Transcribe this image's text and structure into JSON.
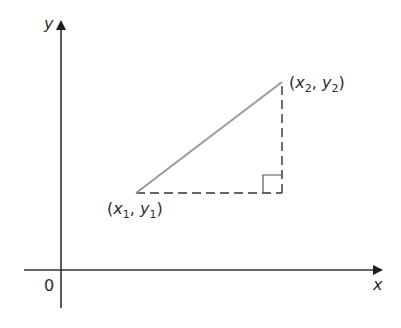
{
  "diagram": {
    "type": "coordinate-geometry-right-triangle",
    "colors": {
      "axis": "#333333",
      "hypotenuse": "#9a9a9a",
      "dashed_legs": "#333333",
      "right_angle_mark": "#555555",
      "text": "#2b2b2b",
      "background": "#ffffff"
    },
    "axes": {
      "x_label": "x",
      "y_label": "y",
      "origin_label": "0"
    },
    "points": [
      {
        "name": "point-1",
        "var_x": "x",
        "sub_x": "1",
        "var_y": "y",
        "sub_y": "1",
        "open": "(",
        "sep": ",",
        "close": ")"
      },
      {
        "name": "point-2",
        "var_x": "x",
        "sub_x": "2",
        "var_y": "y",
        "sub_y": "2",
        "open": "(",
        "sep": ",",
        "close": ")"
      }
    ],
    "elements": {
      "hypotenuse": "solid segment from (x1, y1) to (x2, y2)",
      "horizontal_leg": "dashed segment from (x1, y1) to (x2, y1)",
      "vertical_leg": "dashed segment from (x2, y1) to (x2, y2)",
      "right_angle": "square marker at (x2, y1)"
    }
  }
}
